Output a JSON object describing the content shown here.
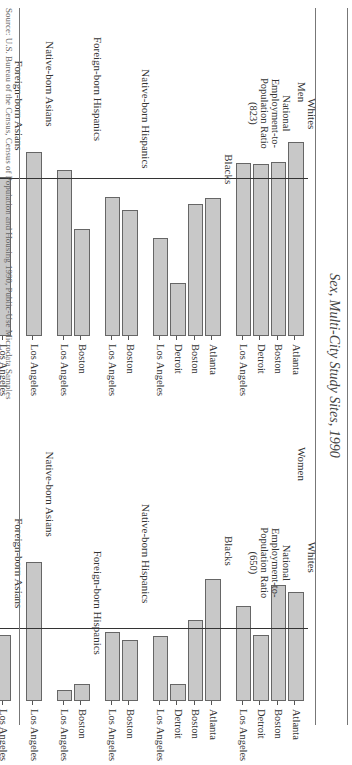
{
  "title": "Sex, Multi-City Study Sites, 1990",
  "source": "Source: U.S. Bureau of the Census, Census of Population and Housing 1990, Public-Use Microdata Samples",
  "orientation": "figure rotated 90 degrees clockwise on page",
  "chart_data": [
    {
      "type": "bar",
      "title": "Men",
      "xlabel": "",
      "ylabel": "Employed Persons per 1,000",
      "ylim": [
        500,
        1000
      ],
      "yticks": [
        "500",
        "600",
        "700",
        "800",
        "900",
        "1,000"
      ],
      "reference_line": {
        "label": "National Employment-to-Population Ratio",
        "value_label": "(823)",
        "value": 823
      },
      "groups": [
        {
          "name": "Whites",
          "categories": [
            "Atlanta",
            "Boston",
            "Detroit",
            "Los Angeles"
          ],
          "values": [
            898,
            857,
            852,
            855
          ]
        },
        {
          "name": "Blacks",
          "categories": [
            "Atlanta",
            "Boston",
            "Detroit",
            "Los Angeles"
          ],
          "values": [
            783,
            771,
            609,
            701
          ]
        },
        {
          "name": "Native-born Hispanics",
          "categories": [
            "Boston",
            "Los Angeles"
          ],
          "values": [
            758,
            785
          ]
        },
        {
          "name": "Foreign-born Hispanics",
          "categories": [
            "Boston",
            "Los Angeles"
          ],
          "values": [
            719,
            840
          ]
        },
        {
          "name": "Native-born Asians",
          "categories": [
            "Los Angeles"
          ],
          "values": [
            877
          ]
        },
        {
          "name": "Foreign-born Asians",
          "categories": [
            "Los Angeles"
          ],
          "values": [
            826
          ]
        }
      ]
    },
    {
      "type": "bar",
      "title": "Women",
      "xlabel": "",
      "ylabel": "Employed Persons per 1,000",
      "ylim": [
        500,
        1000
      ],
      "yticks": [
        "500",
        "600",
        "700",
        "800",
        "900",
        "1,000"
      ],
      "reference_line": {
        "label": "National Employment-to-Population Ratio",
        "value_label": "(650)",
        "value": 650
      },
      "groups": [
        {
          "name": "Whites",
          "categories": [
            "Atlanta",
            "Boston",
            "Detroit",
            "Los Angeles"
          ],
          "values": [
            723,
            737,
            636,
            694
          ]
        },
        {
          "name": "Blacks",
          "categories": [
            "Atlanta",
            "Boston",
            "Detroit",
            "Los Angeles"
          ],
          "values": [
            749,
            667,
            535,
            634
          ]
        },
        {
          "name": "Native-born Hispanics",
          "categories": [
            "Boston",
            "Los Angeles"
          ],
          "values": [
            626,
            642
          ]
        },
        {
          "name": "Foreign-born Hispanics",
          "categories": [
            "Boston",
            "Los Angeles"
          ],
          "values": [
            535,
            523
          ]
        },
        {
          "name": "Native-born Asians",
          "categories": [
            "Los Angeles"
          ],
          "values": [
            784
          ]
        },
        {
          "name": "Foreign-born Asians",
          "categories": [
            "Los Angeles"
          ],
          "values": [
            636
          ]
        }
      ]
    }
  ],
  "panels": {
    "men": {
      "label": "Men",
      "annot": [
        "National",
        "Employment-to-",
        "Population Ratio",
        "(823)"
      ],
      "xlabel": "Employed Persons per 1,000"
    },
    "women": {
      "label": "Women",
      "annot": [
        "National",
        "Employment-to-",
        "Population Ratio",
        "(650)"
      ],
      "xlabel": "Employed Persons per 1,000"
    }
  }
}
